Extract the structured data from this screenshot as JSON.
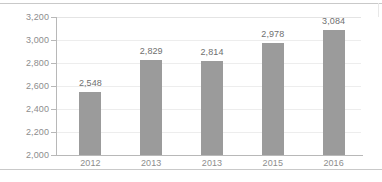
{
  "chart_data": {
    "type": "bar",
    "title": "",
    "subtitle": "",
    "xlabel": "",
    "ylabel": "",
    "categories": [
      "2012",
      "2013",
      "2013",
      "2015",
      "2016"
    ],
    "values": [
      2548,
      2829,
      2814,
      2978,
      3084
    ],
    "value_labels": [
      "2,548",
      "2,829",
      "2,814",
      "2,978",
      "3,084"
    ],
    "ylim": [
      2000,
      3200
    ],
    "ytick_step": 200,
    "ytick_labels": [
      "3,200",
      "3,000",
      "2,800",
      "2,600",
      "2,400",
      "2,200",
      "2,000"
    ],
    "ytick_values": [
      3200,
      3000,
      2800,
      2600,
      2400,
      2200,
      2000
    ],
    "grid": "horizontal",
    "legend": "none",
    "series": [
      {
        "name": "",
        "values": [
          2548,
          2829,
          2814,
          2978,
          3084
        ],
        "color": "#9b9b9b"
      }
    ],
    "annotations": [],
    "colors": {
      "bar": "#9b9b9b",
      "axis": "#b8b8b8",
      "gridline": "#ededed",
      "tick_text": "#8d8d8d",
      "value_text": "#6f6f6f",
      "frame": "#c9c9c9",
      "background": "#ffffff"
    }
  }
}
